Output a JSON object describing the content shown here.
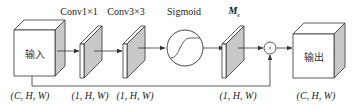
{
  "diagram": {
    "type": "spatial-attention-module",
    "colors": {
      "stroke": "#333333",
      "shade": "#c8c8c8",
      "face": "#ffffff"
    },
    "nodes": {
      "input": {
        "label": "输入",
        "shape": "(C, H, W)"
      },
      "conv1": {
        "title": "Conv1×1",
        "shape": "(1, H, W)"
      },
      "conv3": {
        "title": "Conv3×3",
        "shape": "(1, H, W)"
      },
      "sigmoid": {
        "title": "Sigmoid"
      },
      "ms": {
        "title_main": "M",
        "title_sub": "s",
        "shape": "(1, H, W)"
      },
      "multiply": {
        "symbol": "×"
      },
      "output": {
        "label": "输出",
        "shape": "(C, H, W)"
      }
    }
  }
}
